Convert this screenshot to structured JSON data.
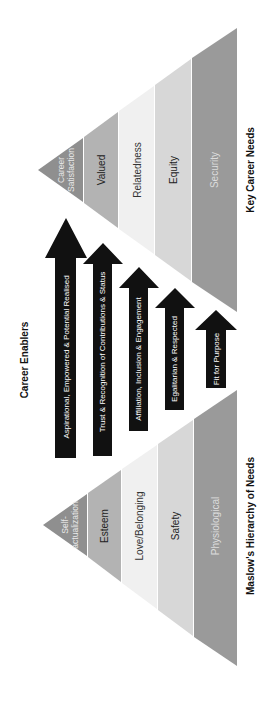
{
  "diagram": {
    "orientation": "rotated 90 degrees counter-clockwise",
    "career_needs": {
      "title": "Key Career Needs",
      "levels": [
        {
          "label_lines": [
            "Career",
            "Satisfaction"
          ],
          "color": "#8f8f8f",
          "text_color": "#e8e8e8"
        },
        {
          "label_lines": [
            "Valued"
          ],
          "color": "#b3b3b3",
          "text_color": "#222222"
        },
        {
          "label_lines": [
            "Relatedness"
          ],
          "color": "#f0f0f0",
          "text_color": "#333333"
        },
        {
          "label_lines": [
            "Equity"
          ],
          "color": "#d7d7d7",
          "text_color": "#222222"
        },
        {
          "label_lines": [
            "Security"
          ],
          "color": "#9a9a9a",
          "text_color": "#dcdcdc"
        }
      ]
    },
    "enablers": {
      "title": "Career Enablers",
      "arrows": [
        {
          "label": "Aspirational, Empowered & Potential Realised"
        },
        {
          "label": "Trust & Recognition of Contributions & Status"
        },
        {
          "label": "Affiliation, Inclusion & Engagement"
        },
        {
          "label": "Egalitarian & Respected"
        },
        {
          "label": "Fit for Purpose"
        }
      ],
      "arrow_color": "#111111",
      "arrow_text_color": "#ffffff"
    },
    "maslow": {
      "title": "Maslow's Hierarchy of Needs",
      "levels": [
        {
          "label_lines": [
            "Self-",
            "actualization"
          ],
          "color": "#8f8f8f",
          "text_color": "#e8e8e8"
        },
        {
          "label_lines": [
            "Esteem"
          ],
          "color": "#b3b3b3",
          "text_color": "#222222"
        },
        {
          "label_lines": [
            "Love/Belonging"
          ],
          "color": "#f0f0f0",
          "text_color": "#333333"
        },
        {
          "label_lines": [
            "Safety"
          ],
          "color": "#d7d7d7",
          "text_color": "#222222"
        },
        {
          "label_lines": [
            "Physiological"
          ],
          "color": "#9a9a9a",
          "text_color": "#dcdcdc"
        }
      ]
    }
  }
}
